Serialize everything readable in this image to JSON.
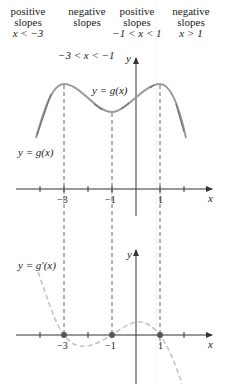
{
  "regions": [
    {
      "line1": "positive",
      "line2": "slopes",
      "condition": "x < −3"
    },
    {
      "line1": "negative",
      "line2": "slopes",
      "condition": "−3 < x < −1"
    },
    {
      "line1": "positive",
      "line2": "slopes",
      "condition": "−1 < x < 1"
    },
    {
      "line1": "negative",
      "line2": "slopes",
      "condition": "x > 1"
    }
  ],
  "top_graph": {
    "curve_label_inner": "y = g(x)",
    "curve_label_left": "y = g(x)",
    "y_axis_label": "y",
    "x_axis_label": "x",
    "tick_labels": [
      "−3",
      "−1",
      "1"
    ]
  },
  "bottom_graph": {
    "curve_label": "y = g′(x)",
    "y_axis_label": "y",
    "x_axis_label": "x",
    "tick_labels": [
      "−3",
      "−1",
      "1"
    ],
    "zeros": [
      -3,
      -1,
      1
    ]
  },
  "colors": {
    "axis": "#333333",
    "curve": "#9a9a9a",
    "derivative_curve": "#c4c4c4",
    "dashed_guide": "#555555",
    "zero_dot": "#555555"
  }
}
